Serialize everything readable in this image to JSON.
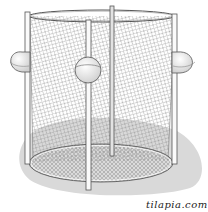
{
  "figure": {
    "caption": "tilapia.com",
    "colors": {
      "background": "#ffffff",
      "shadow": "#d9d9d9",
      "mesh": "#8a8a8a",
      "outline": "#555555",
      "float_fill": "#f4f4f4",
      "bottom_mesh": "#bdbdbd"
    },
    "parts": {
      "top_ring": "top-ring",
      "bottom_ring": "bottom-ring",
      "poles": 4,
      "floats": 3
    }
  }
}
